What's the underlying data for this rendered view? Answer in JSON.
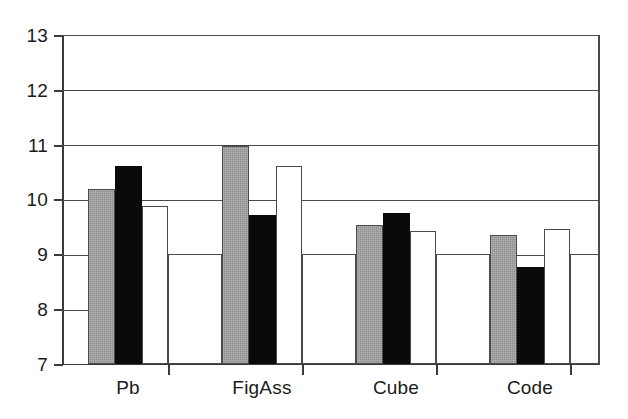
{
  "chart_data": {
    "type": "bar",
    "title": "",
    "subtitle": "",
    "xlabel": "",
    "ylabel": "",
    "categories": [
      "Pb",
      "FigAss",
      "Cube",
      "Code"
    ],
    "series": [
      {
        "name": "series-1",
        "style": "gray",
        "color": "#8f8f8f",
        "values": [
          10.2,
          11.0,
          9.55,
          9.36
        ]
      },
      {
        "name": "series-2",
        "style": "black",
        "color": "#0a0a0a",
        "values": [
          10.63,
          9.72,
          9.76,
          8.78
        ]
      },
      {
        "name": "series-3",
        "style": "white",
        "color": "#ffffff",
        "values": [
          9.9,
          10.62,
          9.44,
          9.47
        ]
      }
    ],
    "ylim": [
      7,
      13
    ],
    "yticks": [
      13,
      12,
      11,
      10,
      9,
      8,
      7
    ],
    "ytick_labels": [
      "13",
      "12",
      "11",
      "10",
      "9",
      "8",
      "7"
    ],
    "grid": true,
    "grid_axis": "y",
    "legend": false,
    "legend_position": "none",
    "annotations": []
  },
  "axis": {
    "y_labels": [
      "13",
      "12",
      "11",
      "10",
      "9",
      "8",
      "7"
    ],
    "x_labels": [
      "Pb",
      "FigAss",
      "Cube",
      "Code"
    ]
  },
  "style": {
    "background": "#ffffff",
    "axis_color": "#3a3a3a",
    "grid_color": "#4a4a4a",
    "bar_gray": "#8f8f8f",
    "bar_black": "#0a0a0a",
    "bar_white": "#ffffff"
  }
}
